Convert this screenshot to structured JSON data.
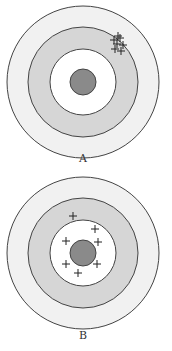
{
  "figure": {
    "colors": {
      "outer_ring": "#f1f1f1",
      "middle_ring": "#d6d6d6",
      "inner_ring": "#ffffff",
      "bullseye": "#8a8a8a",
      "stroke": "#444444",
      "marks": "#222222"
    },
    "targets": [
      {
        "label": "A",
        "description": "Tightly clustered shots, off-center (upper right, in middle ring)",
        "marks": [
          [
            114,
            40
          ],
          [
            120,
            38
          ],
          [
            117,
            44
          ],
          [
            123,
            45
          ],
          [
            115,
            49
          ],
          [
            121,
            51
          ],
          [
            118,
            36
          ]
        ]
      },
      {
        "label": "B",
        "description": "Shots scattered around the bullseye, roughly centered",
        "marks": [
          [
            73,
            216
          ],
          [
            95,
            229
          ],
          [
            66,
            241
          ],
          [
            98,
            242
          ],
          [
            66,
            264
          ],
          [
            97,
            264
          ],
          [
            78,
            273
          ]
        ]
      }
    ]
  }
}
